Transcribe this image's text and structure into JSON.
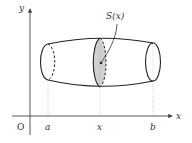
{
  "diagram": {
    "axes": {
      "x_label": "x",
      "y_label": "y",
      "origin_label": "O"
    },
    "tick_labels": {
      "a": "a",
      "x": "x",
      "b": "b"
    },
    "cross_section_label": "S(x)",
    "colors": {
      "stroke": "#222222",
      "axis": "#444444",
      "shade": "#d0d0d0",
      "guide": "#bbbbbb"
    }
  }
}
